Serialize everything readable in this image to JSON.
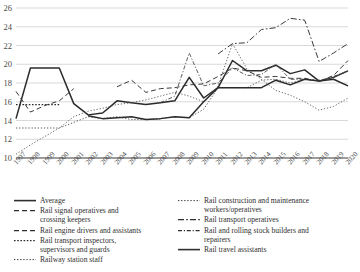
{
  "chart_data": {
    "type": "line",
    "title": "",
    "xlabel": "",
    "ylabel": "",
    "ylim": [
      10,
      26
    ],
    "ytick_step": 2,
    "yticks": [
      10,
      12,
      14,
      16,
      18,
      20,
      22,
      24,
      26
    ],
    "grid": true,
    "legend_position": "bottom",
    "categories": [
      "1997",
      "1998",
      "1999",
      "2000",
      "2001",
      "2002",
      "2003",
      "2004",
      "2005",
      "2006",
      "2007",
      "2008",
      "2009",
      "2010",
      "2011",
      "2012",
      "2013",
      "2014",
      "2015",
      "2016",
      "2017",
      "2018",
      "2019",
      "2020"
    ],
    "series": [
      {
        "name": "Average",
        "style": "solid",
        "width": 1.5,
        "color": "#2b2b2b",
        "values": [
          14.2,
          19.6,
          19.6,
          19.6,
          15.8,
          14.6,
          14.8,
          16.1,
          15.9,
          15.7,
          15.9,
          16.1,
          18.6,
          16.4,
          17.5,
          20.4,
          19.3,
          19.3,
          19.9,
          19.0,
          19.4,
          18.2,
          18.6,
          19.3
        ]
      },
      {
        "name": "Rail signal operatives and\ncrossing keepers",
        "style": "dashed",
        "width": 1.0,
        "color": "#3a3a3a",
        "values": [
          17.1,
          14.9,
          15.6,
          16.1,
          17.4,
          null,
          null,
          null,
          null,
          null,
          null,
          null,
          null,
          null,
          null,
          null,
          null,
          null,
          null,
          null,
          null,
          null,
          null,
          null
        ]
      },
      {
        "name": "Rail engine drivers and assistants",
        "style": "dashed",
        "width": 1.0,
        "color": "#3a3a3a",
        "values": [
          null,
          null,
          null,
          null,
          null,
          null,
          null,
          17.6,
          18.3,
          17.0,
          17.4,
          17.5,
          17.8,
          17.9,
          18.7,
          19.6,
          19.3,
          18.6,
          18.7,
          18.5,
          18.5,
          18.2,
          18.8,
          20.4
        ]
      },
      {
        "name": "Rail transport inspectors,\nsupervisors and guards",
        "style": "dotted-thick",
        "width": 1.3,
        "color": "#2f2f2f",
        "values": [
          15.7,
          15.7,
          15.7,
          15.7,
          null,
          null,
          null,
          null,
          null,
          null,
          null,
          null,
          null,
          null,
          null,
          null,
          null,
          null,
          null,
          null,
          null,
          null,
          null,
          null
        ]
      },
      {
        "name": "Railway station staff",
        "style": "dotted-fine",
        "width": 0.9,
        "color": "#4a4a4a",
        "values": [
          13.2,
          13.2,
          13.2,
          13.2,
          13.8,
          14.4,
          14.2,
          14.4,
          14.1,
          14.1,
          14.2,
          14.4,
          14.3,
          15.2,
          17.5,
          17.5,
          17.5,
          18.3,
          18.4,
          18.0,
          18.4,
          18.3,
          18.6,
          19.3
        ]
      },
      {
        "name": "Rail construction and maintenance\nworkers/operatives",
        "style": "dotted-fine",
        "width": 0.9,
        "color": "#5a5a5a",
        "values": [
          10.4,
          11.4,
          12.3,
          13.2,
          14.4,
          15.0,
          15.3,
          15.7,
          15.9,
          16.2,
          16.6,
          17.0,
          16.6,
          16.0,
          17.7,
          22.2,
          19.5,
          18.4,
          17.2,
          16.7,
          16.0,
          15.1,
          15.5,
          16.4
        ]
      },
      {
        "name": "Rail transport operatives",
        "style": "dashdot",
        "width": 1.0,
        "color": "#3a3a3a",
        "values": [
          null,
          null,
          null,
          null,
          null,
          null,
          null,
          null,
          null,
          null,
          null,
          null,
          null,
          null,
          21.1,
          22.2,
          22.3,
          23.7,
          23.9,
          24.9,
          24.7,
          20.3,
          21.2,
          22.2
        ]
      },
      {
        "name": "Rail and rolling stock builders and\nrepairers",
        "style": "dashdot-fine",
        "width": 0.9,
        "color": "#4a4a4a",
        "values": [
          null,
          null,
          null,
          null,
          null,
          null,
          null,
          null,
          null,
          null,
          15.9,
          16.6,
          21.2,
          17.7,
          18.0,
          19.6,
          18.8,
          18.9,
          20.0,
          18.4,
          18.4,
          18.2,
          18.7,
          19.3
        ]
      },
      {
        "name": "Rail travel assistants",
        "style": "solid",
        "width": 1.5,
        "color": "#2b2b2b",
        "values": [
          null,
          null,
          null,
          null,
          null,
          14.5,
          14.2,
          14.3,
          14.4,
          14.1,
          14.2,
          14.4,
          14.3,
          16.0,
          17.5,
          17.5,
          17.5,
          17.5,
          18.3,
          17.8,
          18.4,
          18.2,
          18.4,
          17.7
        ]
      }
    ]
  },
  "legend": {
    "left_column": [
      {
        "label": "Average",
        "style": "solid"
      },
      {
        "label": "Rail signal operatives and\ncrossing keepers",
        "style": "dashed"
      },
      {
        "label": "Rail engine drivers and assistants",
        "style": "dashed"
      },
      {
        "label": "Rail transport inspectors,\nsupervisors and guards",
        "style": "dotted-thick"
      },
      {
        "label": "Railway station staff",
        "style": "dotted-fine"
      }
    ],
    "right_column": [
      {
        "label": "Rail construction and maintenance\nworkers/operatives",
        "style": "dotted-fine"
      },
      {
        "label": "Rail transport operatives",
        "style": "dashdot"
      },
      {
        "label": "Rail and rolling stock builders and\nrepairers",
        "style": "dashdot-fine"
      },
      {
        "label": "Rail travel assistants",
        "style": "solid"
      }
    ]
  },
  "axes": {
    "y_tick_labels": [
      "26",
      "24",
      "22",
      "20",
      "18",
      "16",
      "14",
      "12",
      "10"
    ],
    "x_tick_labels": [
      "1997",
      "1998",
      "1999",
      "2000",
      "2001",
      "2002",
      "2003",
      "2004",
      "2005",
      "2006",
      "2007",
      "2008",
      "2009",
      "2010",
      "2011",
      "2012",
      "2013",
      "2014",
      "2015",
      "2016",
      "2017",
      "2018",
      "2019",
      "2020"
    ]
  },
  "colors": {
    "grid": "#c9c9c9",
    "axis": "#3a3a3a",
    "text": "#3a3a3a"
  }
}
